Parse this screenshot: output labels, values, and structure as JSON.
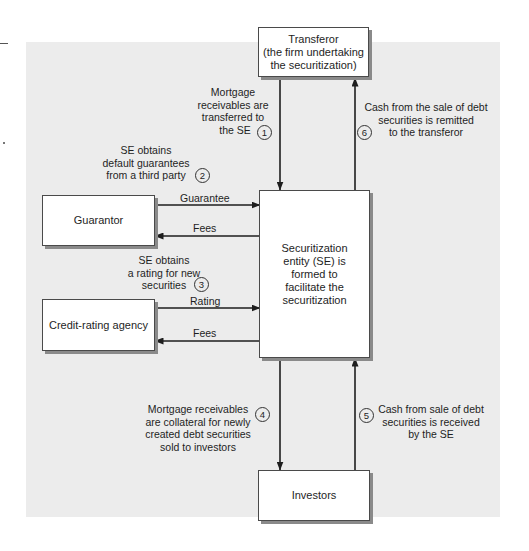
{
  "diagram": {
    "type": "flowchart",
    "title": "",
    "colors": {
      "panel_background": "#ececec",
      "box_fill": "#ffffff",
      "box_border": "#4a4a4a",
      "box_shadow": "#8a8a8a",
      "arrow": "#1e1e1e"
    },
    "nodes": {
      "transferor": {
        "lines": [
          "Transferor",
          "(the firm undertaking",
          "the securitization)"
        ]
      },
      "se": {
        "lines": [
          "Securitization",
          "entity (SE) is",
          "formed to",
          "facilitate the",
          "securitization"
        ]
      },
      "guarantor": {
        "label": "Guarantor"
      },
      "rating_agency": {
        "label": "Credit-rating agency"
      },
      "investors": {
        "label": "Investors"
      }
    },
    "edges": {
      "guarantee": "Guarantee",
      "guarantor_fees": "Fees",
      "rating": "Rating",
      "rating_fees": "Fees"
    },
    "steps": [
      {
        "number": "1",
        "lines": [
          "Mortgage",
          "receivables are",
          "transferred to",
          "the SE"
        ]
      },
      {
        "number": "2",
        "lines": [
          "SE obtains",
          "default guarantees",
          "from a third party"
        ]
      },
      {
        "number": "3",
        "lines": [
          "SE obtains",
          "a rating for new",
          "securities"
        ]
      },
      {
        "number": "4",
        "lines": [
          "Mortgage receivables",
          "are collateral for newly",
          "created debt securities",
          "sold to investors"
        ]
      },
      {
        "number": "5",
        "lines": [
          "Cash from sale of debt",
          "securities is received",
          "by the SE"
        ]
      },
      {
        "number": "6",
        "lines": [
          "Cash from the sale of debt",
          "securities is remitted",
          "to the transferor"
        ]
      }
    ]
  }
}
